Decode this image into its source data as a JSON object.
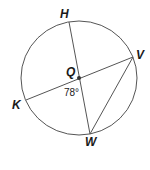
{
  "diagram": {
    "type": "circle-geometry",
    "circle": {
      "center_label": "Q",
      "cx": 79,
      "cy": 78,
      "rx": 58,
      "ry": 57,
      "stroke": "#555555"
    },
    "points": {
      "H": {
        "label": "H",
        "x": 69,
        "y": 22
      },
      "V": {
        "label": "V",
        "x": 133,
        "y": 57
      },
      "K": {
        "label": "K",
        "x": 26,
        "y": 100
      },
      "W": {
        "label": "W",
        "x": 90,
        "y": 134
      },
      "Q": {
        "label": "Q",
        "x": 79,
        "y": 78
      }
    },
    "segments": [
      {
        "from": "H",
        "to": "W",
        "name": "diameter-HW"
      },
      {
        "from": "K",
        "to": "V",
        "name": "diameter-KV"
      },
      {
        "from": "V",
        "to": "W",
        "name": "chord-VW"
      }
    ],
    "angle": {
      "label": "78°",
      "vertex": "Q",
      "between": [
        "K",
        "W"
      ]
    }
  }
}
